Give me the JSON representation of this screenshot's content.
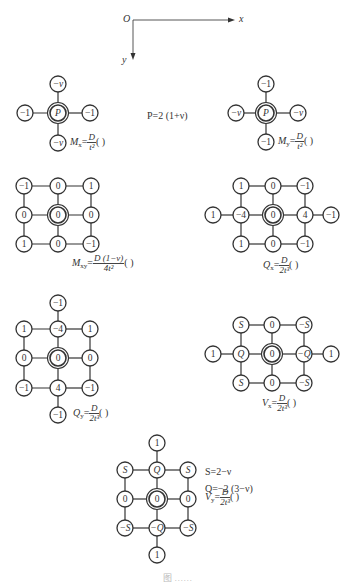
{
  "axes": {
    "origin_label": "O",
    "x_label": "x",
    "y_label": "y",
    "origin": [
      133,
      20
    ],
    "x_end": [
      235,
      20
    ],
    "y_end": [
      133,
      60
    ]
  },
  "node_style": {
    "radius": 8,
    "stroke": "#333333",
    "fill": "#ffffff",
    "line": "#333333"
  },
  "stencils": [
    {
      "id": "Mx",
      "formula": {
        "symbol": "M",
        "subscript": "x",
        "numerator": "D",
        "denominator": "t²",
        "suffix": "(   )"
      },
      "formula_pos": [
        70,
        143
      ],
      "nodes": [
        {
          "x": 58,
          "y": 113,
          "label": "P",
          "center": true
        },
        {
          "x": 58,
          "y": 84,
          "label": "−ν"
        },
        {
          "x": 58,
          "y": 143,
          "label": "−ν"
        },
        {
          "x": 25,
          "y": 113,
          "label": "−1"
        },
        {
          "x": 90,
          "y": 113,
          "label": "−1"
        }
      ],
      "edges": [
        [
          0,
          1
        ],
        [
          0,
          2
        ],
        [
          0,
          3
        ],
        [
          0,
          4
        ]
      ]
    },
    {
      "id": "My",
      "formula": {
        "symbol": "M",
        "subscript": "y",
        "numerator": "D",
        "denominator": "t²",
        "suffix": "(   )"
      },
      "formula_pos": [
        278,
        142
      ],
      "nodes": [
        {
          "x": 266,
          "y": 113,
          "label": "P",
          "center": true
        },
        {
          "x": 266,
          "y": 84,
          "label": "−1"
        },
        {
          "x": 266,
          "y": 142,
          "label": "−1"
        },
        {
          "x": 236,
          "y": 113,
          "label": "−ν"
        },
        {
          "x": 298,
          "y": 113,
          "label": "−ν"
        }
      ],
      "edges": [
        [
          0,
          1
        ],
        [
          0,
          2
        ],
        [
          0,
          3
        ],
        [
          0,
          4
        ]
      ]
    },
    {
      "id": "Mxy",
      "formula": {
        "symbol": "M",
        "subscript": "xy",
        "numerator": "D (1−ν)",
        "denominator": "4t²",
        "suffix": "(   )"
      },
      "formula_pos": [
        72,
        264
      ],
      "nodes": [
        {
          "x": 24,
          "y": 186,
          "label": "−1"
        },
        {
          "x": 58,
          "y": 186,
          "label": "0"
        },
        {
          "x": 91,
          "y": 186,
          "label": "1"
        },
        {
          "x": 24,
          "y": 215,
          "label": "0"
        },
        {
          "x": 58,
          "y": 215,
          "label": "0",
          "center": true
        },
        {
          "x": 91,
          "y": 215,
          "label": "0"
        },
        {
          "x": 24,
          "y": 244,
          "label": "1"
        },
        {
          "x": 58,
          "y": 244,
          "label": "0"
        },
        {
          "x": 91,
          "y": 244,
          "label": "−1"
        }
      ],
      "edges": [
        [
          0,
          1
        ],
        [
          1,
          2
        ],
        [
          3,
          4
        ],
        [
          4,
          5
        ],
        [
          6,
          7
        ],
        [
          7,
          8
        ],
        [
          0,
          3
        ],
        [
          3,
          6
        ],
        [
          1,
          4
        ],
        [
          4,
          7
        ],
        [
          2,
          5
        ],
        [
          5,
          8
        ]
      ]
    },
    {
      "id": "Qx",
      "formula": {
        "symbol": "Q",
        "subscript": "x",
        "numerator": "D",
        "denominator": "2t³",
        "suffix": "(   )"
      },
      "formula_pos": [
        263,
        266
      ],
      "nodes": [
        {
          "x": 241,
          "y": 186,
          "label": "1"
        },
        {
          "x": 273,
          "y": 186,
          "label": "0"
        },
        {
          "x": 305,
          "y": 186,
          "label": "−1"
        },
        {
          "x": 213,
          "y": 215,
          "label": "1"
        },
        {
          "x": 241,
          "y": 215,
          "label": "−4"
        },
        {
          "x": 273,
          "y": 215,
          "label": "0",
          "center": true
        },
        {
          "x": 305,
          "y": 215,
          "label": "4"
        },
        {
          "x": 331,
          "y": 215,
          "label": "−1"
        },
        {
          "x": 241,
          "y": 244,
          "label": "1"
        },
        {
          "x": 273,
          "y": 244,
          "label": "0"
        },
        {
          "x": 305,
          "y": 244,
          "label": "−1"
        }
      ],
      "edges": [
        [
          0,
          1
        ],
        [
          1,
          2
        ],
        [
          3,
          4
        ],
        [
          4,
          5
        ],
        [
          5,
          6
        ],
        [
          6,
          7
        ],
        [
          8,
          9
        ],
        [
          9,
          10
        ],
        [
          0,
          4
        ],
        [
          4,
          8
        ],
        [
          1,
          5
        ],
        [
          5,
          9
        ],
        [
          2,
          6
        ],
        [
          6,
          10
        ]
      ]
    },
    {
      "id": "Qy",
      "formula": {
        "symbol": "Q",
        "subscript": "y",
        "numerator": "D",
        "denominator": "2t³",
        "suffix": "(   )"
      },
      "formula_pos": [
        73,
        414
      ],
      "nodes": [
        {
          "x": 58,
          "y": 303,
          "label": "−1"
        },
        {
          "x": 24,
          "y": 329,
          "label": "1"
        },
        {
          "x": 58,
          "y": 329,
          "label": "−4"
        },
        {
          "x": 90,
          "y": 329,
          "label": "1"
        },
        {
          "x": 24,
          "y": 358,
          "label": "0"
        },
        {
          "x": 58,
          "y": 358,
          "label": "0",
          "center": true
        },
        {
          "x": 90,
          "y": 358,
          "label": "0"
        },
        {
          "x": 24,
          "y": 388,
          "label": "−1"
        },
        {
          "x": 58,
          "y": 388,
          "label": "4"
        },
        {
          "x": 90,
          "y": 388,
          "label": "−1"
        },
        {
          "x": 58,
          "y": 415,
          "label": "−1"
        }
      ],
      "edges": [
        [
          0,
          2
        ],
        [
          1,
          2
        ],
        [
          2,
          3
        ],
        [
          4,
          5
        ],
        [
          5,
          6
        ],
        [
          7,
          8
        ],
        [
          8,
          9
        ],
        [
          1,
          4
        ],
        [
          4,
          7
        ],
        [
          2,
          5
        ],
        [
          5,
          8
        ],
        [
          3,
          6
        ],
        [
          6,
          9
        ],
        [
          8,
          10
        ]
      ]
    },
    {
      "id": "Vx",
      "formula": {
        "symbol": "V",
        "subscript": "x",
        "numerator": "D",
        "denominator": "2t³",
        "suffix": "(   )"
      },
      "formula_pos": [
        262,
        404
      ],
      "nodes": [
        {
          "x": 241,
          "y": 325,
          "label": "S"
        },
        {
          "x": 272,
          "y": 325,
          "label": "0"
        },
        {
          "x": 304,
          "y": 325,
          "label": "−S"
        },
        {
          "x": 213,
          "y": 354,
          "label": "1"
        },
        {
          "x": 241,
          "y": 354,
          "label": "Q"
        },
        {
          "x": 272,
          "y": 354,
          "label": "0",
          "center": true
        },
        {
          "x": 304,
          "y": 354,
          "label": "−Q"
        },
        {
          "x": 331,
          "y": 354,
          "label": "1"
        },
        {
          "x": 241,
          "y": 383,
          "label": "S"
        },
        {
          "x": 272,
          "y": 383,
          "label": "0"
        },
        {
          "x": 304,
          "y": 383,
          "label": "−S"
        }
      ],
      "edges": [
        [
          0,
          1
        ],
        [
          1,
          2
        ],
        [
          3,
          4
        ],
        [
          4,
          5
        ],
        [
          5,
          6
        ],
        [
          6,
          7
        ],
        [
          8,
          9
        ],
        [
          9,
          10
        ],
        [
          0,
          4
        ],
        [
          4,
          8
        ],
        [
          1,
          5
        ],
        [
          5,
          9
        ],
        [
          2,
          6
        ],
        [
          6,
          10
        ]
      ]
    },
    {
      "id": "Vy",
      "formula": {
        "symbol": "V",
        "subscript": "y",
        "numerator": "D",
        "denominator": "2t³",
        "suffix": "(   )"
      },
      "formula_pos": [
        205,
        498
      ],
      "nodes": [
        {
          "x": 157,
          "y": 443,
          "label": "1"
        },
        {
          "x": 125,
          "y": 470,
          "label": "S"
        },
        {
          "x": 157,
          "y": 470,
          "label": "Q"
        },
        {
          "x": 188,
          "y": 470,
          "label": "S"
        },
        {
          "x": 125,
          "y": 499,
          "label": "0"
        },
        {
          "x": 157,
          "y": 499,
          "label": "0",
          "center": true
        },
        {
          "x": 188,
          "y": 499,
          "label": "0"
        },
        {
          "x": 125,
          "y": 528,
          "label": "−S"
        },
        {
          "x": 157,
          "y": 528,
          "label": "−Q"
        },
        {
          "x": 188,
          "y": 528,
          "label": "−S"
        },
        {
          "x": 157,
          "y": 555,
          "label": "1"
        }
      ],
      "edges": [
        [
          0,
          2
        ],
        [
          1,
          2
        ],
        [
          2,
          3
        ],
        [
          4,
          5
        ],
        [
          5,
          6
        ],
        [
          7,
          8
        ],
        [
          8,
          9
        ],
        [
          1,
          4
        ],
        [
          4,
          7
        ],
        [
          2,
          5
        ],
        [
          5,
          8
        ],
        [
          3,
          6
        ],
        [
          6,
          9
        ],
        [
          8,
          10
        ]
      ]
    }
  ],
  "annotations": {
    "P_def": "P=2 (1+ν)",
    "S_def": "S=2−ν",
    "Q_def": "Q=−2 (3−ν)"
  },
  "caption": "图 ……"
}
